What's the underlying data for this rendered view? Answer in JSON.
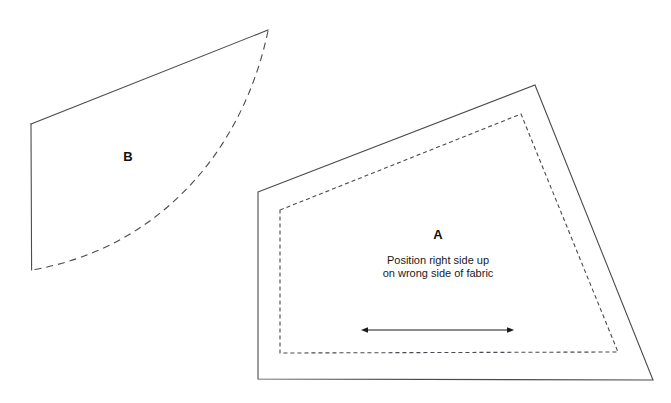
{
  "canvas": {
    "width": 671,
    "height": 403,
    "background": "#ffffff"
  },
  "style": {
    "line_color": "#4a4a52",
    "solid_stroke_width": 1.1,
    "dashed_stroke_width": 1.1,
    "cut_line_dash": "7,5",
    "seam_line_dash": "4,3",
    "arrow_color": "#1a1a1a",
    "text_color": "#1a1a1a"
  },
  "pieces": [
    {
      "id": "piece-b",
      "label": "B",
      "label_position": {
        "x": 128,
        "y": 158
      },
      "solid_outline_points": "31,124 268,30",
      "left_edge": {
        "x1": 31,
        "y1": 124,
        "x2": 32,
        "y2": 270
      },
      "dashed_curve": {
        "start": {
          "x": 268,
          "y": 31
        },
        "control1": {
          "x": 243,
          "y": 150
        },
        "control2": {
          "x": 160,
          "y": 248
        },
        "end": {
          "x": 32,
          "y": 270
        }
      }
    },
    {
      "id": "piece-a",
      "label": "A",
      "label_position": {
        "x": 438,
        "y": 236
      },
      "cutting_line_points": "258,192 535,85 653,380 258,379",
      "seam_line_points": "280,210 521,114 618,352 280,353",
      "instructions": [
        "Position right side up",
        "on wrong side of fabric"
      ],
      "instruction_position": {
        "x": 438,
        "y": 261,
        "line_height": 13
      },
      "grainline_arrow": {
        "x1": 363,
        "y1": 330,
        "x2": 512,
        "y2": 330,
        "double_headed": true
      }
    }
  ]
}
